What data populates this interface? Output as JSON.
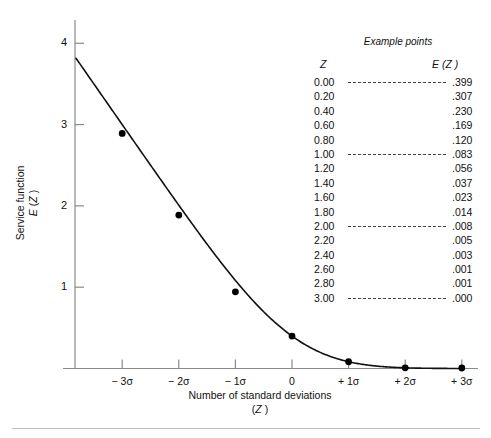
{
  "chart_data": {
    "type": "line",
    "title": "",
    "xlabel": "Number of standard deviations (Z)",
    "ylabel": "Service function E (Z)",
    "xlim": [
      -3.6,
      3.4
    ],
    "ylim": [
      0,
      4.3
    ],
    "grid": false,
    "legend": "none",
    "x_tick_labels": [
      "− 3σ",
      "− 2σ",
      "− 1σ",
      "0",
      "+ 1σ",
      "+ 2σ",
      "+ 3σ"
    ],
    "x_tick_values": [
      -3,
      -2,
      -1,
      0,
      1,
      2,
      3
    ],
    "y_tick_labels": [
      "1",
      "2",
      "3",
      "4"
    ],
    "y_tick_values": [
      1,
      2,
      3,
      4
    ],
    "marked_points": {
      "x": [
        -3,
        -2,
        -1,
        0,
        1,
        2,
        3
      ],
      "y": [
        2.891,
        1.887,
        0.943,
        0.399,
        0.083,
        0.008,
        0.0
      ]
    },
    "series": [
      {
        "name": "Service function E(Z)",
        "x": [
          -3.6,
          -3.4,
          -3.2,
          -3.0,
          -2.8,
          -2.6,
          -2.4,
          -2.2,
          -2.0,
          -1.8,
          -1.6,
          -1.4,
          -1.2,
          -1.0,
          -0.8,
          -0.6,
          -0.4,
          -0.2,
          0.0,
          0.2,
          0.4,
          0.6,
          0.8,
          1.0,
          1.2,
          1.4,
          1.6,
          1.8,
          2.0,
          2.2,
          2.4,
          2.6,
          2.8,
          3.0,
          3.2,
          3.4
        ],
        "y": [
          3.949,
          3.801,
          3.601,
          2.891,
          2.801,
          2.601,
          2.401,
          2.201,
          1.887,
          1.801,
          1.602,
          1.403,
          1.206,
          0.943,
          0.82,
          0.63,
          0.467,
          0.334,
          0.399,
          0.307,
          0.23,
          0.169,
          0.12,
          0.083,
          0.056,
          0.037,
          0.023,
          0.014,
          0.008,
          0.005,
          0.003,
          0.001,
          0.001,
          0.0,
          0.0,
          0.0
        ]
      }
    ]
  },
  "axis": {
    "y_ticks": [
      {
        "label": "4"
      },
      {
        "label": "3"
      },
      {
        "label": "2"
      },
      {
        "label": "1"
      }
    ],
    "x_ticks": [
      {
        "label": "− 3σ"
      },
      {
        "label": "− 2σ"
      },
      {
        "label": "− 1σ"
      },
      {
        "label": "0"
      },
      {
        "label": "+ 1σ"
      },
      {
        "label": "+ 2σ"
      },
      {
        "label": "+ 3σ"
      }
    ],
    "ylabel_line1": "Service function",
    "ylabel_line2_e": "E",
    "ylabel_line2_rest": " (",
    "ylabel_line2_z": "Z",
    "ylabel_line2_close": " )",
    "xlabel_line1": "Number of standard deviations",
    "xlabel_line2_open": "(",
    "xlabel_line2_z": "Z",
    "xlabel_line2_close": " )"
  },
  "table": {
    "title": "Example points",
    "header_z": "Z",
    "header_ez_e": "E",
    "header_ez_open": " (",
    "header_ez_z": "Z",
    "header_ez_close": " )",
    "rows": [
      {
        "z": "0.00",
        "ez": ".399",
        "leader": true
      },
      {
        "z": "0.20",
        "ez": ".307",
        "leader": false
      },
      {
        "z": "0.40",
        "ez": ".230",
        "leader": false
      },
      {
        "z": "0.60",
        "ez": ".169",
        "leader": false
      },
      {
        "z": "0.80",
        "ez": ".120",
        "leader": false
      },
      {
        "z": "1.00",
        "ez": ".083",
        "leader": true
      },
      {
        "z": "1.20",
        "ez": ".056",
        "leader": false
      },
      {
        "z": "1.40",
        "ez": ".037",
        "leader": false
      },
      {
        "z": "1.60",
        "ez": ".023",
        "leader": false
      },
      {
        "z": "1.80",
        "ez": ".014",
        "leader": false
      },
      {
        "z": "2.00",
        "ez": ".008",
        "leader": true
      },
      {
        "z": "2.20",
        "ez": ".005",
        "leader": false
      },
      {
        "z": "2.40",
        "ez": ".003",
        "leader": false
      },
      {
        "z": "2.60",
        "ez": ".001",
        "leader": false
      },
      {
        "z": "2.80",
        "ez": ".001",
        "leader": false
      },
      {
        "z": "3.00",
        "ez": ".000",
        "leader": true
      }
    ]
  },
  "colors": {
    "curve": "#111111",
    "axis": "#8a8a8a",
    "marker": "#000000",
    "background": "#ffffff",
    "rule": "#bdbdbd"
  }
}
